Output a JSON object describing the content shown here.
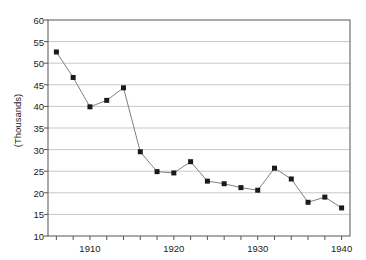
{
  "chart_data": {
    "type": "line",
    "title": "",
    "subtitle": "",
    "xlabel": "",
    "ylabel": "(Thousands)",
    "xlim": [
      1905,
      1941
    ],
    "ylim": [
      10,
      60
    ],
    "grid": true,
    "grid_axis": "y",
    "legend": false,
    "legend_position": "none",
    "marker": "square",
    "marker_color": "#1a1a1a",
    "line_color": "#808080",
    "x_tick_labels": [
      "1910",
      "1920",
      "1930",
      "1940"
    ],
    "x_tick_values": [
      1910,
      1920,
      1930,
      1940
    ],
    "x_minor_tick_values": [
      1906,
      1908,
      1910,
      1912,
      1914,
      1916,
      1918,
      1920,
      1922,
      1924,
      1926,
      1928,
      1930,
      1932,
      1934,
      1936,
      1938,
      1940
    ],
    "y_tick_labels": [
      "10",
      "15",
      "20",
      "25",
      "30",
      "35",
      "40",
      "45",
      "50",
      "55",
      "60"
    ],
    "y_tick_values": [
      10,
      15,
      20,
      25,
      30,
      35,
      40,
      45,
      50,
      55,
      60
    ],
    "x": [
      1906,
      1908,
      1910,
      1912,
      1914,
      1916,
      1918,
      1920,
      1922,
      1924,
      1926,
      1928,
      1930,
      1932,
      1934,
      1936,
      1938,
      1940
    ],
    "values": [
      52.6,
      46.7,
      39.9,
      41.4,
      44.3,
      29.5,
      24.9,
      24.6,
      27.2,
      22.7,
      22.1,
      21.2,
      20.6,
      25.7,
      23.2,
      17.8,
      19.0,
      16.5
    ]
  },
  "colors": {
    "axis": "#555555",
    "gridline": "#c8c8c8",
    "line": "#808080",
    "marker": "#1a1a1a",
    "text": "#1a1a1a",
    "background": "#ffffff"
  }
}
